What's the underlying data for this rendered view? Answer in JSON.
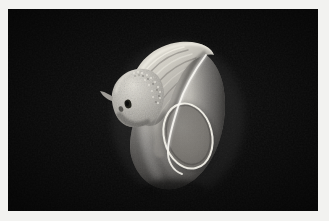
{
  "viewer": {
    "background_color": "#0a0a0a",
    "frame_color": "#f2f2f0",
    "frame_inset_px": 8,
    "canvas_width": 310,
    "canvas_height": 202,
    "caption": ""
  },
  "render": {
    "title": "volume-rendered specimen",
    "description": "Grayscale 3D volume rendering of a rounded anatomical specimen on a black background",
    "modality_look": "grayscale volume rendering",
    "lighting": "key light from upper left",
    "palette": {
      "background": "#0a0a0a",
      "body_mid": "#8e8e8a",
      "body_light": "#c9c7c0",
      "body_highlight": "#e8e6de",
      "body_shadow": "#4a4a47",
      "body_deep_shadow": "#2a2a28",
      "ostium_fill": "#6e6e6a",
      "ostium_rim": "#f4f2ea",
      "ridge_light": "#d8d5cc",
      "ridge_dark": "#6a6a66",
      "pore_dark": "#141412"
    },
    "features": [
      {
        "name": "body",
        "label": "main rounded body"
      },
      {
        "name": "aperture",
        "label": "oval aperture with bright rim"
      },
      {
        "name": "crest",
        "label": "hooked upper crest"
      },
      {
        "name": "ridges",
        "label": "concentric growth ridges"
      },
      {
        "name": "granular-lobe",
        "label": "granular textured left lobe"
      },
      {
        "name": "pore",
        "label": "dark pore on left lobe"
      },
      {
        "name": "highlight-seam",
        "label": "bright S-curve seam"
      }
    ]
  }
}
